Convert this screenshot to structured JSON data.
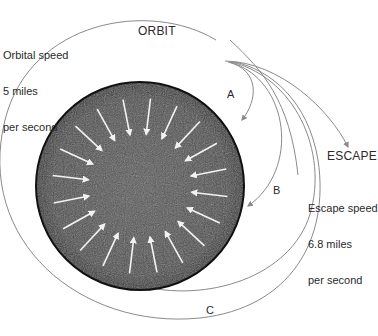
{
  "diagram": {
    "title_label": "ORBIT",
    "escape_label": "ESCAPE",
    "orbital_speed": {
      "line1": "Orbital speed",
      "line2": "5 miles",
      "line3": "per second"
    },
    "escape_speed": {
      "line1": "Escape speed",
      "line2": "6.8 miles",
      "line3": "per second"
    },
    "trajectory_labels": {
      "a": "A",
      "b": "B",
      "c": "C"
    },
    "colors": {
      "earth_fill": "#4a4a4a",
      "earth_edge": "#111111",
      "path_stroke": "#8a8a8a",
      "arrow_inward": "#f2f2f2",
      "text": "#2a2a2a"
    },
    "earth": {
      "cx": 140,
      "cy": 186,
      "r": 104
    },
    "inward_arrow_count": 20
  }
}
